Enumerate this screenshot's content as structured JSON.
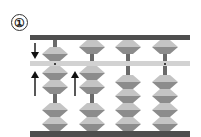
{
  "label": {
    "text": "①"
  },
  "colors": {
    "frame": "#4e4e4e",
    "bar": "#d2d2d2",
    "rod": "#6a6a6a",
    "bead_light": "#c4c4c4",
    "bead_dark": "#8c8c8c",
    "arrow": "#111111"
  },
  "abacus": {
    "type": "soroban",
    "columns": [
      {
        "index": 1,
        "x_center": 55,
        "unit_dot": true,
        "heaven_bead": "moving-down",
        "earth_beads_up": 2,
        "earth_beads_down": 2,
        "arrows": [
          "down-to-heaven",
          "up-to-earth"
        ]
      },
      {
        "index": 2,
        "x_center": 92,
        "unit_dot": false,
        "heaven_bead": "up",
        "earth_beads_up": 2,
        "earth_beads_down": 2,
        "arrows": [
          "up-to-earth"
        ]
      },
      {
        "index": 3,
        "x_center": 128,
        "unit_dot": false,
        "heaven_bead": "up",
        "earth_beads_up": 0,
        "earth_beads_down": 4,
        "arrows": []
      },
      {
        "index": 4,
        "x_center": 165,
        "unit_dot": true,
        "heaven_bead": "up",
        "earth_beads_up": 0,
        "earth_beads_down": 4,
        "arrows": []
      }
    ]
  }
}
